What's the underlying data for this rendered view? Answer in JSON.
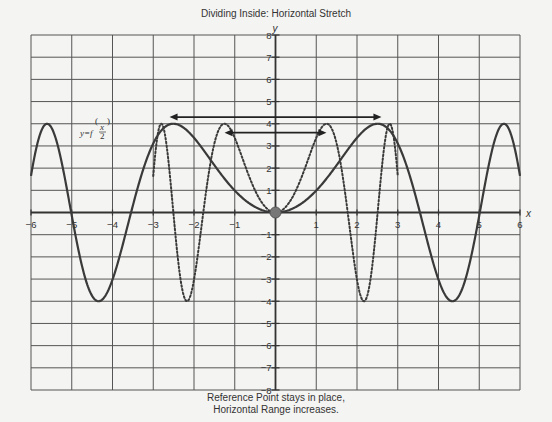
{
  "chart_data": {
    "type": "line",
    "title": "Dividing Inside: Horizontal Stretch",
    "xlabel": "x",
    "ylabel": "y",
    "xlim": [
      -6,
      6
    ],
    "ylim": [
      -8,
      8
    ],
    "grid": true,
    "x_ticks": [
      -6,
      -5,
      -4,
      -3,
      -2,
      -1,
      1,
      2,
      3,
      4,
      5,
      6
    ],
    "y_ticks": [
      -8,
      -7,
      -6,
      -5,
      -4,
      -3,
      -2,
      -1,
      1,
      2,
      3,
      4,
      5,
      6,
      7,
      8
    ],
    "series": [
      {
        "name": "y = f(x)",
        "style": "dotted",
        "description": "original function, approx 4·sin(x²)",
        "x_range": [
          -3,
          3
        ],
        "key_points": [
          [
            -3,
            1.65
          ],
          [
            -2.8,
            4
          ],
          [
            -2.17,
            -4
          ],
          [
            -1.25,
            4
          ],
          [
            0,
            0
          ],
          [
            1.25,
            4
          ],
          [
            2.17,
            -4
          ],
          [
            2.8,
            4
          ],
          [
            3,
            1.65
          ]
        ]
      },
      {
        "name": "y = f(x/2)",
        "style": "solid",
        "description": "horizontally stretched, approx 4·sin(x²/4)",
        "x_range": [
          -6,
          6
        ],
        "key_points": [
          [
            -6,
            1.65
          ],
          [
            -5.6,
            4
          ],
          [
            -4.34,
            -4
          ],
          [
            -2.51,
            4
          ],
          [
            0,
            0
          ],
          [
            2.51,
            4
          ],
          [
            4.34,
            -4
          ],
          [
            5.6,
            4
          ],
          [
            6,
            1.65
          ]
        ]
      }
    ],
    "annotations": {
      "function_label": "y=f(x/2)",
      "reference_point": [
        0,
        0
      ],
      "arrows": [
        {
          "name": "stretched-range",
          "from": [
            -2.6,
            4.3
          ],
          "to": [
            2.6,
            4.3
          ]
        },
        {
          "name": "original-range",
          "from": [
            -1.25,
            3.6
          ],
          "to": [
            1.25,
            3.6
          ]
        }
      ],
      "caption_lines": [
        "Reference Point stays in place,",
        "Horizontal Range increases."
      ]
    }
  },
  "labels": {
    "title": "Dividing Inside: Horizontal Stretch",
    "x_axis": "x",
    "y_axis": "y",
    "fn_prefix": "y=f",
    "fn_num": "x",
    "fn_den": "2",
    "caption_line1": "Reference Point stays in place,",
    "caption_line2": "Horizontal Range increases."
  },
  "colors": {
    "grid": "#555555",
    "curve": "#3a3a3a",
    "reference_point": "#777777",
    "background": "#f4f4f2"
  }
}
